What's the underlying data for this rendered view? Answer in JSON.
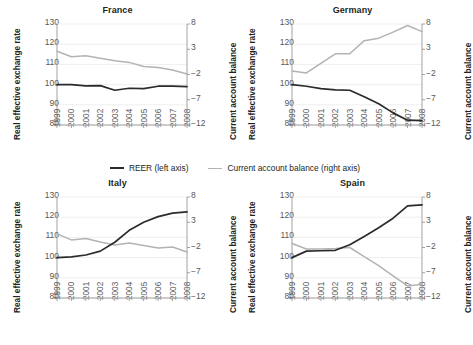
{
  "figure": {
    "axis_title_left": "Real effective exchange rate",
    "axis_title_right": "Current account balance",
    "colors": {
      "reer": "#2b2b2b",
      "cab": "#b3b3b3",
      "axis": "#8c8c8c",
      "grid": "#e8e8e8",
      "text": "#231f20"
    }
  },
  "legend": {
    "reer_label": "REER (left axis)",
    "cab_label": "Current account balance (right axis)"
  },
  "axes": {
    "left_ticks": [
      "130",
      "120",
      "110",
      "100",
      "90",
      "80"
    ],
    "right_ticks": [
      "8",
      "3",
      "−2",
      "−7",
      "−12"
    ],
    "x_ticks": [
      "1999",
      "2000",
      "2001",
      "2002",
      "2003",
      "2004",
      "2005",
      "2006",
      "2007",
      "2008"
    ]
  },
  "chart_data": [
    {
      "type": "line",
      "title": "France",
      "xlabel": "",
      "ylabel": "Real effective exchange rate",
      "y2label": "Current account balance",
      "x": [
        1999,
        2000,
        2001,
        2002,
        2003,
        2004,
        2005,
        2006,
        2007,
        2008
      ],
      "ylim": [
        80,
        130
      ],
      "y2lim": [
        -12,
        8
      ],
      "grid": true,
      "legend_position": "below-figure",
      "series": [
        {
          "name": "REER (left axis)",
          "axis": "left",
          "color": "#2b2b2b",
          "values": [
            100.0,
            100.0,
            99.4,
            99.5,
            97.2,
            98.2,
            98.0,
            99.2,
            99.2,
            99.0
          ]
        },
        {
          "name": "Current account balance (right axis)",
          "axis": "right",
          "color": "#b3b3b3",
          "values": [
            2.6,
            1.5,
            1.7,
            1.2,
            0.7,
            0.4,
            -0.4,
            -0.6,
            -1.1,
            -1.9
          ]
        }
      ]
    },
    {
      "type": "line",
      "title": "Germany",
      "xlabel": "",
      "ylabel": "Real effective exchange rate",
      "y2label": "Current account balance",
      "x": [
        1999,
        2000,
        2001,
        2002,
        2003,
        2004,
        2005,
        2006,
        2007,
        2008
      ],
      "ylim": [
        80,
        130
      ],
      "y2lim": [
        -12,
        8
      ],
      "grid": true,
      "legend_position": "below-figure",
      "series": [
        {
          "name": "REER (left axis)",
          "axis": "left",
          "color": "#2b2b2b",
          "values": [
            100.0,
            99.2,
            98.0,
            97.4,
            97.2,
            94.0,
            90.5,
            86.0,
            82.4,
            82.2
          ]
        },
        {
          "name": "Current account balance (right axis)",
          "axis": "right",
          "color": "#b3b3b3",
          "values": [
            -1.3,
            -1.7,
            0.2,
            2.1,
            2.1,
            4.7,
            5.2,
            6.4,
            7.7,
            6.5
          ]
        }
      ]
    },
    {
      "type": "line",
      "title": "Italy",
      "xlabel": "",
      "ylabel": "Real effective exchange rate",
      "y2label": "Current account balance",
      "x": [
        1999,
        2000,
        2001,
        2002,
        2003,
        2004,
        2005,
        2006,
        2007,
        2008
      ],
      "ylim": [
        80,
        130
      ],
      "y2lim": [
        -12,
        8
      ],
      "grid": true,
      "legend_position": "below-figure",
      "series": [
        {
          "name": "REER (left axis)",
          "axis": "left",
          "color": "#2b2b2b",
          "values": [
            100.0,
            100.4,
            101.3,
            103.2,
            107.6,
            113.5,
            117.5,
            120.3,
            122.0,
            122.6
          ]
        },
        {
          "name": "Current account balance (right axis)",
          "axis": "right",
          "color": "#b3b3b3",
          "values": [
            0.7,
            -0.5,
            -0.2,
            -0.9,
            -1.5,
            -1.1,
            -1.6,
            -2.1,
            -1.9,
            -2.9
          ]
        }
      ]
    },
    {
      "type": "line",
      "title": "Spain",
      "xlabel": "",
      "ylabel": "Real effective exchange rate",
      "y2label": "Current account balance",
      "x": [
        1999,
        2000,
        2001,
        2002,
        2003,
        2004,
        2005,
        2006,
        2007,
        2008
      ],
      "ylim": [
        80,
        130
      ],
      "y2lim": [
        -12,
        8
      ],
      "grid": true,
      "legend_position": "below-figure",
      "series": [
        {
          "name": "REER (left axis)",
          "axis": "left",
          "color": "#2b2b2b",
          "values": [
            100.0,
            103.2,
            103.4,
            103.6,
            106.4,
            110.5,
            114.8,
            119.5,
            125.6,
            126.1
          ]
        },
        {
          "name": "Current account balance (right axis)",
          "axis": "right",
          "color": "#b3b3b3",
          "values": [
            -1.2,
            -2.3,
            -2.3,
            -2.2,
            -2.0,
            -3.8,
            -5.6,
            -7.6,
            -9.6,
            -9.3
          ]
        }
      ]
    }
  ]
}
